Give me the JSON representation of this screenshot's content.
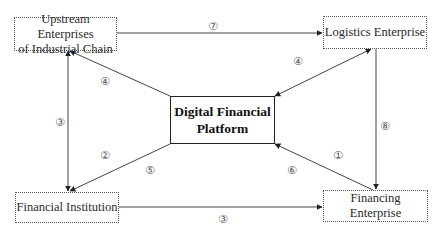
{
  "diagram": {
    "title": "",
    "nodes": {
      "upstream": {
        "label_line1": "Upstream Enterprises",
        "label_line2": "of Industrial Chain"
      },
      "logistics": {
        "label": "Logistics Enterprise"
      },
      "platform": {
        "label_line1": "Digital Financial",
        "label_line2": "Platform"
      },
      "financial_institution": {
        "label": "Financial Institution"
      },
      "financing_enterprise": {
        "label": "Financing Enterprise"
      }
    },
    "edge_labels": {
      "upstream_to_logistics": "⑦",
      "upstream_financial_vertical": "③",
      "platform_to_upstream": "④",
      "platform_to_financial_a": "②",
      "platform_to_financial_b": "⑤",
      "platform_logistics": "④",
      "logistics_to_financing": "⑧",
      "financing_to_platform_a": "①",
      "financing_to_platform_b": "⑥",
      "financial_to_financing": "③"
    },
    "edges": [
      {
        "from": "Upstream Enterprises of Industrial Chain",
        "to": "Logistics Enterprise",
        "label": "⑦"
      },
      {
        "from": "Financial Institution",
        "to": "Upstream Enterprises of Industrial Chain",
        "label": "③",
        "bidirectional": true
      },
      {
        "from": "Digital Financial Platform",
        "to": "Upstream Enterprises of Industrial Chain",
        "label": "④"
      },
      {
        "from": "Digital Financial Platform",
        "to": "Financial Institution",
        "label": "② ⑤"
      },
      {
        "from": "Digital Financial Platform",
        "to": "Logistics Enterprise",
        "label": "④",
        "bidirectional": true
      },
      {
        "from": "Logistics Enterprise",
        "to": "Financing Enterprise",
        "label": "⑧"
      },
      {
        "from": "Financing Enterprise",
        "to": "Digital Financial Platform",
        "label": "① ⑥"
      },
      {
        "from": "Financial Institution",
        "to": "Financing Enterprise",
        "label": "③"
      }
    ],
    "colors": {
      "line": "#444444",
      "text": "#2a2a2a",
      "label": "#555555",
      "background": "#ffffff"
    }
  }
}
